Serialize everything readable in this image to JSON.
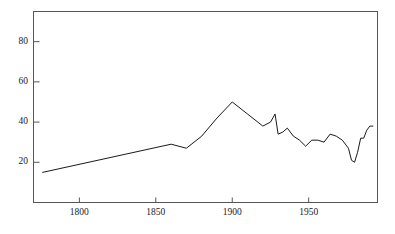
{
  "chart_data": {
    "type": "line",
    "title": "",
    "subtitle": "",
    "xlabel": "",
    "ylabel": "",
    "xlim": [
      1770,
      1995
    ],
    "ylim": [
      0,
      95
    ],
    "xticks": [
      1800,
      1850,
      1900,
      1950
    ],
    "xtick_labels": [
      "1800",
      "1850",
      "1900",
      "1950"
    ],
    "yticks": [
      20,
      40,
      60,
      80
    ],
    "ytick_labels": [
      "20",
      "40",
      "60",
      "80"
    ],
    "grid": false,
    "legend": null,
    "line_color": "#1a1a1a",
    "line_width": 1.0,
    "frame_color": "#555555",
    "series": [
      {
        "name": "series-1",
        "x": [
          1776,
          1860,
          1870,
          1880,
          1890,
          1900,
          1910,
          1920,
          1925,
          1928,
          1930,
          1933,
          1936,
          1940,
          1944,
          1948,
          1952,
          1956,
          1960,
          1964,
          1968,
          1972,
          1976,
          1978,
          1980,
          1982,
          1984,
          1986,
          1988,
          1990,
          1992
        ],
        "y": [
          15,
          29,
          27,
          33,
          42,
          50,
          44,
          38,
          40,
          44,
          34,
          35,
          37,
          33,
          31,
          28,
          31,
          31,
          30,
          34,
          33,
          31,
          27,
          21,
          20,
          25,
          32,
          32,
          36,
          38,
          38
        ]
      }
    ]
  },
  "axis": {
    "x_tick_marks_inward": true,
    "y_tick_marks_inward": true
  }
}
